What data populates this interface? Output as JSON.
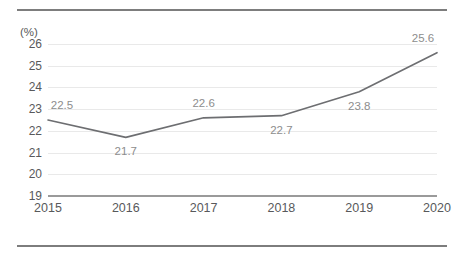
{
  "chart_data": {
    "type": "line",
    "title": "",
    "subtitle": "",
    "xlabel": "",
    "ylabel": "(%)",
    "unit_label": "(%)",
    "categories": [
      "2015",
      "2016",
      "2017",
      "2018",
      "2019",
      "2020"
    ],
    "values": [
      22.5,
      21.7,
      22.6,
      22.7,
      23.8,
      25.6
    ],
    "data_labels": [
      "22.5",
      "21.7",
      "22.6",
      "22.7",
      "23.8",
      "25.6"
    ],
    "label_positions": [
      "above",
      "below",
      "above",
      "below",
      "below",
      "above"
    ],
    "series": [
      {
        "name": "",
        "values": [
          22.5,
          21.7,
          22.6,
          22.7,
          23.8,
          25.6
        ],
        "color": "#6d6e71"
      }
    ],
    "ylim": [
      19,
      26
    ],
    "yticks": [
      19,
      20,
      21,
      22,
      23,
      24,
      25,
      26
    ],
    "ytick_labels": [
      "19",
      "20",
      "21",
      "22",
      "23",
      "24",
      "25",
      "26"
    ],
    "grid": true,
    "grid_color": "#e9e9e9",
    "legend": false,
    "legend_position": "none",
    "axis_color": "#9a9a9a",
    "tick_label_color": "#58595b",
    "data_label_color": "#8d8d8d",
    "frame_rule_color": "#7d7d7d"
  }
}
